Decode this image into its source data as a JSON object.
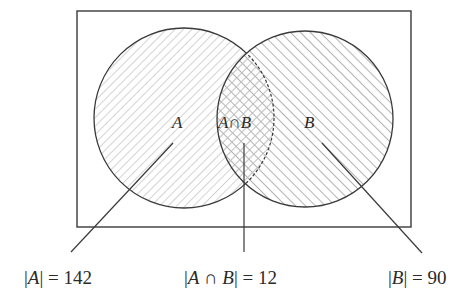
{
  "diagram": {
    "type": "venn",
    "universe": {
      "x": 77,
      "y": 11,
      "width": 334,
      "height": 216
    },
    "sets": [
      {
        "id": "A",
        "label": "A",
        "cx": 184,
        "cy": 118,
        "r": 90,
        "hatch": "forward-diagonal",
        "hatch_color": "#c8c8c8"
      },
      {
        "id": "B",
        "label": "B",
        "cx": 305,
        "cy": 119,
        "r": 88,
        "hatch": "back-diagonal",
        "hatch_color": "#8a8a8a"
      }
    ],
    "intersection": {
      "label": "A∩B",
      "hatch": "cross"
    },
    "labels": {
      "A": "A",
      "intersection": "A∩B",
      "B": "B"
    },
    "captions": {
      "A": {
        "pre": "|",
        "var": "A",
        "post": "| = 142"
      },
      "intersection": {
        "pre": "|",
        "var": "A ∩ B",
        "post": "| = 12"
      },
      "B": {
        "pre": "|",
        "var": "B",
        "post": "| = 90"
      }
    },
    "values": {
      "A": 142,
      "A_and_B": 12,
      "B": 90
    },
    "stroke_color": "#3a3a3a"
  }
}
